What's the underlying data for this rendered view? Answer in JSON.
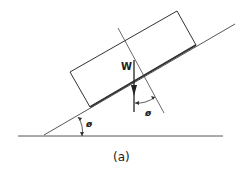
{
  "diagram": {
    "caption": "(a)",
    "weight_label": "W",
    "incline_angle_label": "ø",
    "normal_angle_label": "ø",
    "colors": {
      "line": "#333333",
      "background": "#ffffff"
    }
  }
}
